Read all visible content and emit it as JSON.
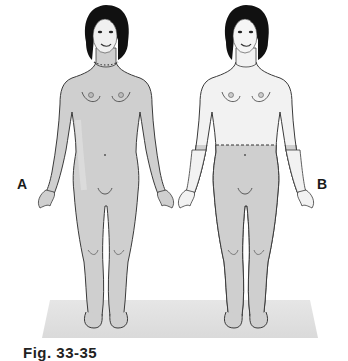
{
  "figure": {
    "caption": "Fig. 33-35",
    "panels": [
      {
        "id": "A",
        "label": "A",
        "shaded_region": "neck down (entire body below dotted neck line)",
        "boundary_line": "dotted line at neck"
      },
      {
        "id": "B",
        "label": "B",
        "shaded_region": "waist down (below dashed waist line)",
        "boundary_line": "dashed line at waist"
      }
    ],
    "colors": {
      "skin_shaded": "#cfcfcf",
      "skin_unshaded": "#f2f2f2",
      "hair": "#111111",
      "outline": "#3a3a3a",
      "floor_shadow": "#e2e2e2",
      "background": "#ffffff"
    }
  }
}
